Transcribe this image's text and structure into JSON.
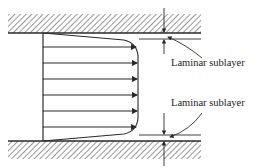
{
  "diagram": {
    "walls": [
      {
        "id": "top-wall",
        "position": "top",
        "style": "hatched"
      },
      {
        "id": "bottom-wall",
        "position": "bottom",
        "style": "hatched"
      }
    ],
    "profile": {
      "arrow_count": 6,
      "shape": "flat turbulent profile with thin near-wall gradient"
    },
    "annotations": [
      {
        "id": "top-sublayer-label",
        "text": "Laminar sublayer"
      },
      {
        "id": "bottom-sublayer-label",
        "text": "Laminar sublayer"
      }
    ],
    "colors": {
      "ink": "#2a2a2a",
      "background": "#ffffff"
    }
  }
}
